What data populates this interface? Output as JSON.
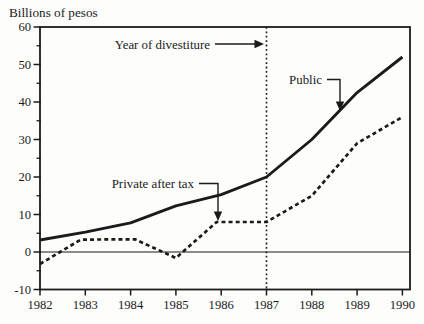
{
  "chart_data": {
    "type": "line",
    "title": "Billions of pesos",
    "xlabel": "",
    "ylabel": "Billions of pesos",
    "xlim": [
      1982,
      1990
    ],
    "ylim": [
      -10,
      60
    ],
    "grid": false,
    "legend_position": "none (inline annotations with arrows)",
    "x_ticks": [
      1982,
      1983,
      1984,
      1985,
      1986,
      1987,
      1988,
      1989,
      1990
    ],
    "y_ticks": [
      60,
      50,
      40,
      30,
      20,
      10,
      0,
      -10
    ],
    "y_minor_ticks": [
      55,
      45,
      35,
      25,
      15,
      5,
      -5
    ],
    "zero_line": true,
    "reference_line": {
      "x": 1987,
      "style": "dotted"
    },
    "series": [
      {
        "name": "Public",
        "line_style": "solid",
        "points": [
          [
            1982,
            3.2
          ],
          [
            1983,
            5.3
          ],
          [
            1984,
            7.8
          ],
          [
            1985,
            12.3
          ],
          [
            1986,
            15.3
          ],
          [
            1987,
            20
          ],
          [
            1988,
            30
          ],
          [
            1989,
            42.5
          ],
          [
            1990,
            52
          ]
        ]
      },
      {
        "name": "Private after tax",
        "line_style": "dashed",
        "points": [
          [
            1982,
            -3.2
          ],
          [
            1982.9,
            3.3
          ],
          [
            1984.1,
            3.4
          ],
          [
            1985,
            -1.6
          ],
          [
            1985.9,
            8
          ],
          [
            1987,
            8
          ],
          [
            1988,
            15
          ],
          [
            1989,
            29
          ],
          [
            1990,
            36
          ]
        ]
      }
    ],
    "annotations": [
      {
        "text": "Year of divestiture",
        "text_pos": [
          210,
          48.5
        ],
        "anchor": "end",
        "polyline": [
          [
            215,
            44
          ],
          [
            255,
            44
          ]
        ],
        "arrow_tip": [
          264,
          44
        ],
        "arrow_dir": "right"
      },
      {
        "text": "Public",
        "text_pos": [
          322,
          84
        ],
        "anchor": "end",
        "polyline": [
          [
            327,
            79.5
          ],
          [
            340,
            79.5
          ],
          [
            340,
            102
          ]
        ],
        "arrow_tip": [
          340,
          111
        ],
        "arrow_dir": "down"
      },
      {
        "text": "Private after tax",
        "text_pos": [
          194,
          188
        ],
        "anchor": "end",
        "polyline": [
          [
            199,
            183.5
          ],
          [
            218,
            183.5
          ],
          [
            218,
            212
          ]
        ],
        "arrow_tip": [
          218,
          221
        ],
        "arrow_dir": "down"
      }
    ],
    "colors": {
      "ink": "#1b1b1b",
      "background": "#fdfdfb"
    }
  }
}
